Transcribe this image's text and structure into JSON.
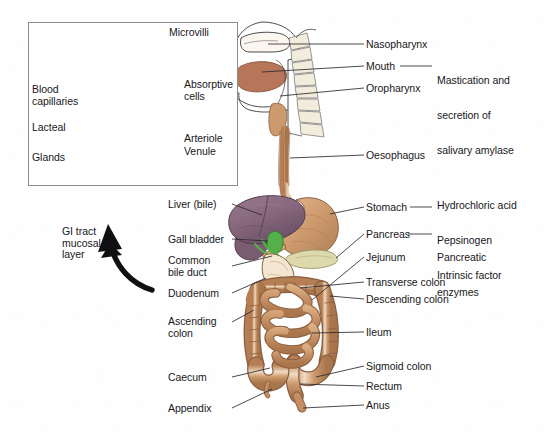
{
  "figure": {
    "background_color": "#ffffff",
    "line_color": "#2b2b2e",
    "text_color": "#18181a"
  },
  "inset": {
    "name": "gi-tract-mucosal-layer-inset",
    "border_color": "#8c8c90",
    "callout_label": "GI tract\nmucosal\nlayer",
    "callout_lines": [
      "GI tract",
      "mucosal",
      "layer"
    ],
    "labels": [
      {
        "id": "microvilli",
        "text": "Microvilli",
        "x": 169,
        "y": 33,
        "align": "left"
      },
      {
        "id": "absorptive-cells",
        "text": "Absorptive\ncells",
        "x": 184,
        "y": 85,
        "align": "left"
      },
      {
        "id": "arteriole",
        "text": "Arteriole",
        "x": 184,
        "y": 136,
        "align": "left"
      },
      {
        "id": "venule",
        "text": "Venule",
        "x": 184,
        "y": 149,
        "align": "left"
      },
      {
        "id": "blood-capillaries",
        "text": "Blood\ncapillaries",
        "x": 32,
        "y": 90,
        "align": "left"
      },
      {
        "id": "lacteal",
        "text": "Lacteal",
        "x": 32,
        "y": 124,
        "align": "left"
      },
      {
        "id": "glands",
        "text": "Glands",
        "x": 32,
        "y": 157,
        "align": "left"
      }
    ],
    "colors": {
      "villi_tissue": "#e8c39d",
      "artery_red": "#d0493f",
      "vein_blue": "#5b8fc9",
      "lacteal_yellow": "#e8cb45",
      "gland_dark": "#2b3572",
      "cell_nucleus": "#4a4f8c",
      "crypt_cream": "#efe0c6"
    }
  },
  "main_labels_right": [
    {
      "id": "nasopharynx",
      "text": "Nasopharynx",
      "x": 366,
      "y": 39
    },
    {
      "id": "mouth",
      "text": "Mouth",
      "x": 366,
      "y": 61
    },
    {
      "id": "oropharynx",
      "text": "Oropharynx",
      "x": 366,
      "y": 83
    },
    {
      "id": "oesophagus",
      "text": "Oesophagus",
      "x": 366,
      "y": 150
    },
    {
      "id": "stomach",
      "text": "Stomach",
      "x": 366,
      "y": 202
    },
    {
      "id": "pancreas",
      "text": "Pancreas",
      "x": 366,
      "y": 229
    },
    {
      "id": "jejunum",
      "text": "Jejunum",
      "x": 366,
      "y": 252
    },
    {
      "id": "transverse-colon",
      "text": "Transverse colon",
      "x": 366,
      "y": 277
    },
    {
      "id": "descending-colon",
      "text": "Descending colon",
      "x": 366,
      "y": 294
    },
    {
      "id": "ileum",
      "text": "Ileum",
      "x": 366,
      "y": 327
    },
    {
      "id": "sigmoid-colon",
      "text": "Sigmoid colon",
      "x": 366,
      "y": 361
    },
    {
      "id": "rectum",
      "text": "Rectum",
      "x": 366,
      "y": 381
    },
    {
      "id": "anus",
      "text": "Anus",
      "x": 366,
      "y": 400
    }
  ],
  "main_labels_left": [
    {
      "id": "liver-bile",
      "text": "Liver (bile)",
      "x": 168,
      "y": 199,
      "lines": [
        "Liver (bile)"
      ]
    },
    {
      "id": "gall-bladder",
      "text": "Gall bladder",
      "x": 168,
      "y": 234,
      "lines": [
        "Gall bladder"
      ]
    },
    {
      "id": "common-bile-duct",
      "text": "Common\nbile duct",
      "x": 168,
      "y": 255,
      "lines": [
        "Common",
        "bile duct"
      ]
    },
    {
      "id": "duodenum",
      "text": "Duodenum",
      "x": 168,
      "y": 288,
      "lines": [
        "Duodenum"
      ]
    },
    {
      "id": "ascending-colon",
      "text": "Ascending\ncolon",
      "x": 168,
      "y": 322,
      "lines": [
        "Ascending",
        "colon"
      ]
    },
    {
      "id": "caecum",
      "text": "Caecum",
      "x": 168,
      "y": 372,
      "lines": [
        "Caecum"
      ]
    },
    {
      "id": "appendix",
      "text": "Appendix",
      "x": 168,
      "y": 403,
      "lines": [
        "Appendix"
      ]
    }
  ],
  "annotations_far_right": [
    {
      "id": "mastication-annotation",
      "lines": [
        "Mastication and",
        "secretion of",
        "salivary amylase"
      ],
      "x": 437,
      "y": 52,
      "linked_to": "mouth"
    },
    {
      "id": "gastric-secretions-annotation",
      "lines": [
        "Hydrochloric acid",
        "Pepsinogen",
        "Intrinsic factor"
      ],
      "x": 437,
      "y": 177,
      "linked_to": "stomach"
    },
    {
      "id": "pancreatic-enzymes-annotation",
      "lines": [
        "Pancreatic",
        "enzymes"
      ],
      "x": 437,
      "y": 229,
      "linked_to": "pancreas"
    }
  ],
  "organ_colors": {
    "gut_tan": "#c58d62",
    "gut_tan_light": "#dcae82",
    "gut_highlight": "#f0dcc2",
    "liver_purple": "#8e6d84",
    "liver_purple_dark": "#6d5268",
    "gall_bladder_green": "#56b04a",
    "pancreas_cream": "#ddd8ad",
    "tongue_brown": "#b7765a",
    "bone_cream": "#f2ecdc",
    "outline": "#3a3a3c"
  }
}
